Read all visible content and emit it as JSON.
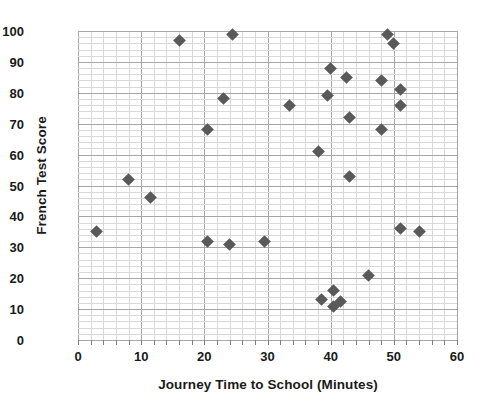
{
  "chart_data": {
    "type": "scatter",
    "title": "",
    "xlabel": "Journey Time to School (Minutes)",
    "ylabel": "French Test Score",
    "xlim": [
      0,
      60
    ],
    "ylim": [
      0,
      100
    ],
    "x_major_step": 10,
    "x_minor_step": 2,
    "y_major_step": 10,
    "y_minor_step": 2,
    "grid": true,
    "legend": "none",
    "marker": "diamond",
    "marker_color": "#595959",
    "x_ticks": [
      0,
      10,
      20,
      30,
      40,
      50,
      60
    ],
    "y_ticks": [
      0,
      10,
      20,
      30,
      40,
      50,
      60,
      70,
      80,
      90,
      100
    ],
    "points": [
      {
        "x": 3,
        "y": 35
      },
      {
        "x": 8,
        "y": 52
      },
      {
        "x": 11.5,
        "y": 46
      },
      {
        "x": 16,
        "y": 97
      },
      {
        "x": 20.5,
        "y": 68
      },
      {
        "x": 20.5,
        "y": 32
      },
      {
        "x": 23,
        "y": 78
      },
      {
        "x": 24,
        "y": 31
      },
      {
        "x": 24.5,
        "y": 99
      },
      {
        "x": 29.5,
        "y": 32
      },
      {
        "x": 33.5,
        "y": 76
      },
      {
        "x": 38,
        "y": 61
      },
      {
        "x": 38.5,
        "y": 13
      },
      {
        "x": 39.5,
        "y": 79
      },
      {
        "x": 40,
        "y": 88
      },
      {
        "x": 40.5,
        "y": 16
      },
      {
        "x": 40.5,
        "y": 11
      },
      {
        "x": 41.5,
        "y": 12.5
      },
      {
        "x": 42.5,
        "y": 85
      },
      {
        "x": 43,
        "y": 72
      },
      {
        "x": 43,
        "y": 53
      },
      {
        "x": 46,
        "y": 21
      },
      {
        "x": 48,
        "y": 84
      },
      {
        "x": 48,
        "y": 68
      },
      {
        "x": 49,
        "y": 99
      },
      {
        "x": 50,
        "y": 96
      },
      {
        "x": 51,
        "y": 81
      },
      {
        "x": 51,
        "y": 76
      },
      {
        "x": 51,
        "y": 36
      },
      {
        "x": 54,
        "y": 35
      }
    ]
  },
  "colors": {
    "marker": "#595959",
    "grid_minor": "#d9d9d9",
    "grid_major": "#a6a6a6",
    "text": "#1a1a1a",
    "background": "#ffffff"
  }
}
